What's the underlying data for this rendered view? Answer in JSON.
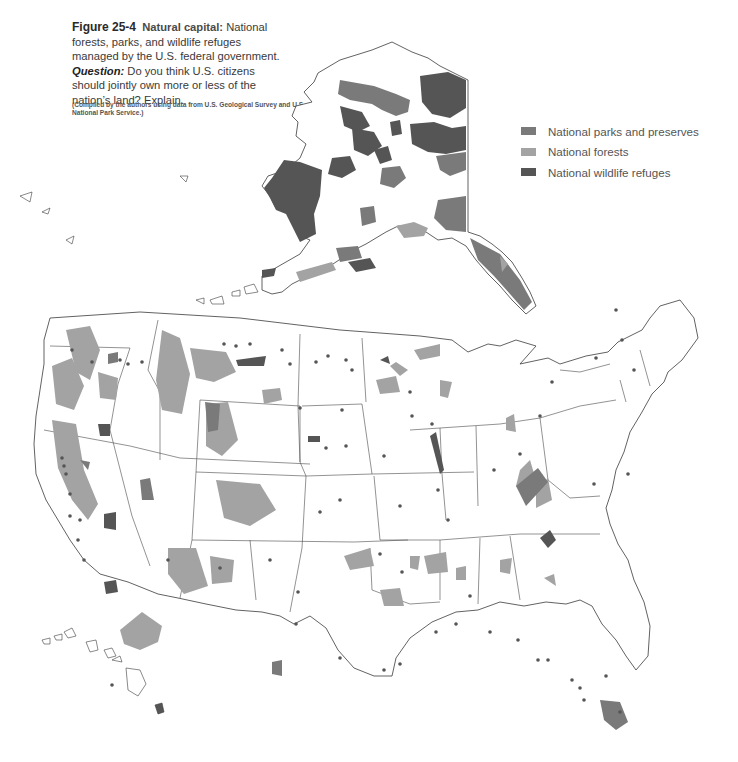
{
  "caption": {
    "figure_number": "Figure 25-4",
    "figure_title": "Natural capital:",
    "description": "National forests, parks, and wildlife refuges managed by the U.S. federal government.",
    "question_label": "Question:",
    "question_text": "Do you think U.S. citizens should jointly own more or less of the nation’s land? Explain.",
    "source": "(Compiled by the authors using data from U.S. Geological Survey and U.S. National Park Service.)"
  },
  "legend": {
    "items": [
      {
        "label": "National parks and preserves",
        "color": "#7a7a7a"
      },
      {
        "label": "National forests",
        "color": "#a3a3a3"
      },
      {
        "label": "National wildlife refuges",
        "color": "#555555"
      }
    ]
  },
  "map": {
    "regions_shown": [
      "Alaska",
      "Contiguous United States",
      "Hawaii"
    ],
    "colors": {
      "parks": "#7a7a7a",
      "forests": "#a3a3a3",
      "refuges": "#555555",
      "border": "#3a3a3a",
      "land": "#ffffff"
    }
  }
}
